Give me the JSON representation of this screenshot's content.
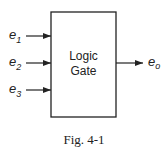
{
  "diagram": {
    "block": {
      "line1": "Logic",
      "line2": "Gate"
    },
    "inputs": [
      {
        "base": "e",
        "sub": "1"
      },
      {
        "base": "e",
        "sub": "2"
      },
      {
        "base": "e",
        "sub": "3"
      }
    ],
    "output": {
      "base": "e",
      "sub": "o"
    },
    "caption": "Fig. 4-1"
  }
}
